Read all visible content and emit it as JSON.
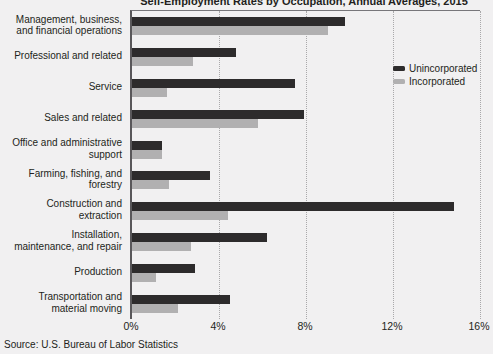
{
  "title": "Self-Employment Rates by Occupation, Annual Averages, 2015",
  "source": "Source: U.S. Bureau of Labor Statistics",
  "colors": {
    "background": "#f1f0f1",
    "text": "#231f20",
    "axis": "#59575a",
    "grid": "#a9a8aa",
    "unincorporated": "#2d2b2c",
    "incorporated": "#b1b0b1"
  },
  "chart_data": {
    "type": "bar",
    "orientation": "horizontal",
    "title": "Self-Employment Rates by Occupation, Annual Averages, 2015",
    "categories": [
      "Management, business,\nand financial operations",
      "Professional and related",
      "Service",
      "Sales and related",
      "Office and administrative\nsupport",
      "Farming, fishing, and\nforestry",
      "Construction and\nextraction",
      "Installation,\nmaintenance, and repair",
      "Production",
      "Transportation and\nmaterial moving"
    ],
    "series": [
      {
        "name": "Unincorporated",
        "color": "#2d2b2c",
        "values": [
          9.8,
          4.8,
          7.5,
          7.9,
          1.4,
          3.6,
          14.8,
          6.2,
          2.9,
          4.5
        ]
      },
      {
        "name": "Incorporated",
        "color": "#b1b0b1",
        "values": [
          9.0,
          2.8,
          1.6,
          5.8,
          1.4,
          1.7,
          4.4,
          2.7,
          1.1,
          2.1
        ]
      }
    ],
    "xlabel": "",
    "ylabel": "",
    "xlim": [
      0,
      16
    ],
    "xticks": [
      "0%",
      "4%",
      "8%",
      "12%",
      "16%"
    ],
    "xtick_values": [
      0,
      4,
      8,
      12,
      16
    ],
    "grid": "vertical-dotted",
    "legend_position": "top-right"
  }
}
